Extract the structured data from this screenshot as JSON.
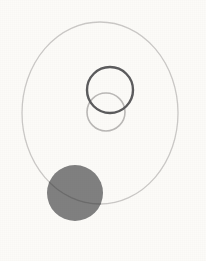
{
  "figure": {
    "width": 206,
    "height": 261,
    "background_color": "#fcfbf8"
  },
  "chart_data": {
    "type": "scatter",
    "xlabel": "",
    "ylabel": "",
    "xlim": [
      0,
      206
    ],
    "ylim": [
      0,
      261
    ],
    "grid": false,
    "legend": "none",
    "shapes": [
      {
        "name": "large-outer-circle",
        "kind": "ellipse",
        "cx": 100,
        "cy": 113,
        "rx": 78,
        "ry": 91,
        "fill": "none",
        "stroke": "#c9c7c5",
        "stroke_width": 1.3,
        "opacity": 0.95,
        "z": 1
      },
      {
        "name": "light-small-circle",
        "kind": "circle",
        "cx": 106,
        "cy": 112,
        "r": 19,
        "fill": "none",
        "stroke": "#b8b6b4",
        "stroke_width": 1.6,
        "opacity": 0.95,
        "z": 2
      },
      {
        "name": "dark-small-circle",
        "kind": "circle",
        "cx": 110,
        "cy": 90,
        "r": 23,
        "fill": "none",
        "stroke": "#5b5b5d",
        "stroke_width": 2.4,
        "opacity": 1,
        "z": 3
      },
      {
        "name": "filled-gray-disc",
        "kind": "circle",
        "cx": 75,
        "cy": 193,
        "r": 28,
        "fill": "#7d7d7d",
        "stroke": "none",
        "stroke_width": 0,
        "opacity": 0.97,
        "z": 4
      },
      {
        "name": "arc-over-disc",
        "kind": "ellipse-arc-overlay",
        "cx": 100,
        "cy": 113,
        "rx": 78,
        "ry": 91,
        "fill": "none",
        "stroke": "#666666",
        "stroke_width": 1.3,
        "opacity": 0.75,
        "z": 5
      }
    ],
    "labels": []
  },
  "colors": {
    "background": "#fcfbf8",
    "outer_circle_stroke": "#c9c7c5",
    "dark_circle_stroke": "#5b5b5d",
    "light_circle_stroke": "#b8b6b4",
    "disc_fill": "#7d7d7d",
    "arc_over_disc": "#666666"
  }
}
